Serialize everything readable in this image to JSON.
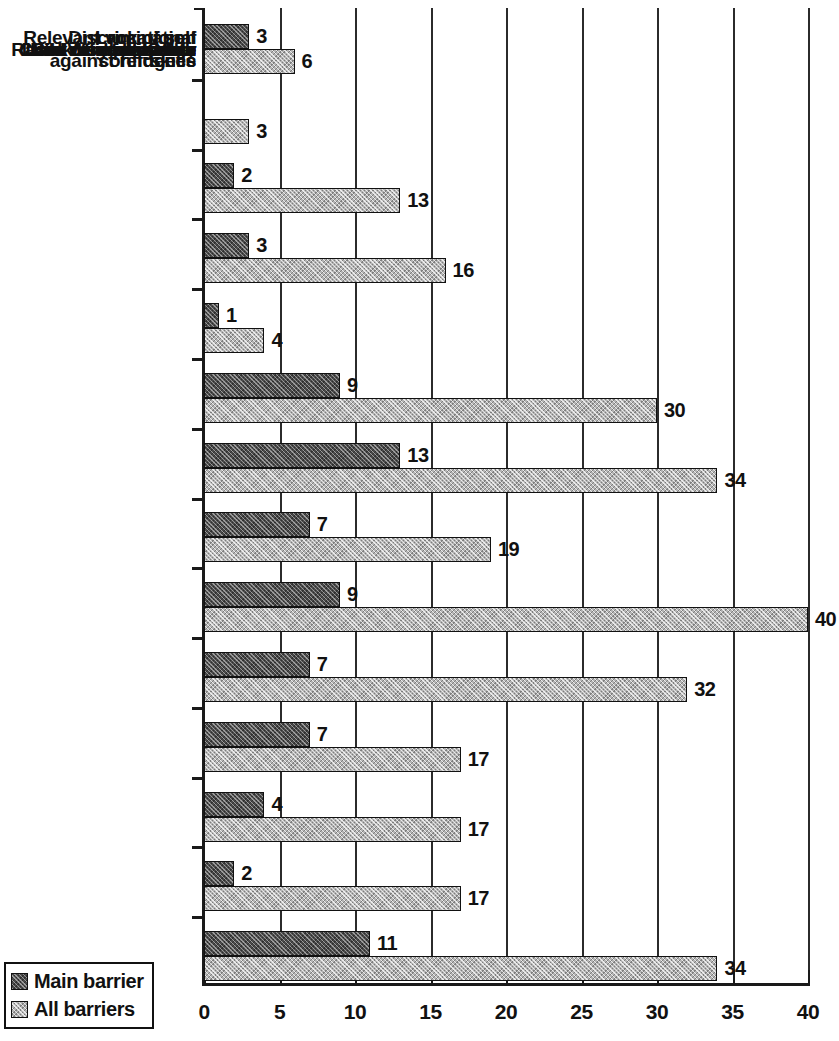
{
  "chart_data": {
    "type": "bar",
    "orientation": "horizontal",
    "title": "",
    "subtitle": "",
    "xlabel": "",
    "ylabel": "",
    "xlim": [
      0,
      40
    ],
    "xticks": [
      0,
      5,
      10,
      15,
      20,
      25,
      30,
      35,
      40
    ],
    "xtick_labels": [
      "0",
      "5",
      "10",
      "15",
      "20",
      "25",
      "30",
      "35",
      "40"
    ],
    "grid": "vertical",
    "legend_position": "bottom-left",
    "categories": [
      "Other",
      "Ill health",
      "Lack of self confidence",
      "Wages too low",
      "Sex discrimination",
      "Racial discrimination",
      "Discrimination against refugees",
      "Little work available",
      "Lack of experience",
      "Lack of information",
      "Child care problems",
      "Relevant vocational skills",
      "Literacy",
      "Language"
    ],
    "category_lines": [
      [
        "Other"
      ],
      [
        "Ill health"
      ],
      [
        "Lack of self",
        "confidence"
      ],
      [
        "Wages too low"
      ],
      [
        "Sex discrimination"
      ],
      [
        "Racial discrimination"
      ],
      [
        "Discrimination",
        "against refugees"
      ],
      [
        "Little work available"
      ],
      [
        "Lack of experience"
      ],
      [
        "Lack of information"
      ],
      [
        "Child care problems"
      ],
      [
        "Relevant vocational",
        "skills"
      ],
      [
        "Literacy"
      ],
      [
        "Language"
      ]
    ],
    "series": [
      {
        "name": "Main barrier",
        "color": "#4a4a4a",
        "values": [
          3,
          null,
          2,
          3,
          1,
          9,
          13,
          7,
          9,
          7,
          7,
          4,
          2,
          11
        ],
        "labels": [
          "3",
          "",
          "2",
          "3",
          "1",
          "9",
          "13",
          "7",
          "9",
          "7",
          "7",
          "4",
          "2",
          "11"
        ]
      },
      {
        "name": "All barriers",
        "color": "#b4b4b4",
        "values": [
          6,
          3,
          13,
          16,
          4,
          30,
          34,
          19,
          40,
          32,
          17,
          17,
          17,
          34
        ],
        "labels": [
          "6",
          "3",
          "13",
          "16",
          "4",
          "30",
          "34",
          "19",
          "40",
          "32",
          "17",
          "17",
          "17",
          "34"
        ]
      }
    ]
  },
  "legend": {
    "items": [
      {
        "label": "Main barrier",
        "swatch": "main"
      },
      {
        "label": "All barriers",
        "swatch": "all"
      }
    ]
  }
}
